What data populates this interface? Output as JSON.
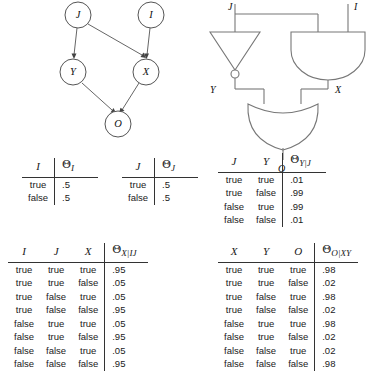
{
  "figure": {
    "caption": "",
    "dag": {
      "title": "bayesian-network",
      "nodes": [
        {
          "id": "J",
          "label": "J",
          "cx": 78,
          "cy": 15
        },
        {
          "id": "I",
          "label": "I",
          "cx": 151,
          "cy": 15
        },
        {
          "id": "Y",
          "label": "Y",
          "cx": 73,
          "cy": 72
        },
        {
          "id": "X",
          "label": "X",
          "cx": 146,
          "cy": 72
        },
        {
          "id": "O",
          "label": "O",
          "cx": 118,
          "cy": 124
        }
      ],
      "edges": [
        {
          "from": "J",
          "to": "Y"
        },
        {
          "from": "J",
          "to": "X"
        },
        {
          "from": "I",
          "to": "X"
        },
        {
          "from": "Y",
          "to": "O"
        },
        {
          "from": "X",
          "to": "O"
        }
      ]
    },
    "circuit": {
      "title": "logic-circuit",
      "input_labels": [
        "J",
        "I"
      ],
      "internal_labels": [
        "Y",
        "X"
      ],
      "output_label": "O",
      "gates": [
        {
          "name": "not-gate",
          "type": "NOT",
          "inputs": [
            "J"
          ],
          "output": "Y"
        },
        {
          "name": "and-gate",
          "type": "AND",
          "inputs": [
            "J",
            "I"
          ],
          "output": "X"
        },
        {
          "name": "or-gate",
          "type": "OR",
          "inputs": [
            "Y",
            "X"
          ],
          "output": "O"
        }
      ]
    }
  },
  "tables": {
    "table_i": {
      "name": "cpt-i",
      "headers": [
        "I",
        "Θ",
        "I"
      ],
      "var_header": "I",
      "theta_base": "Θ",
      "theta_sub": "I",
      "rows": [
        {
          "cells": [
            "true"
          ],
          "param": ".5"
        },
        {
          "cells": [
            "false"
          ],
          "param": ".5"
        }
      ]
    },
    "table_j": {
      "name": "cpt-j",
      "var_header": "J",
      "theta_base": "Θ",
      "theta_sub": "J",
      "rows": [
        {
          "cells": [
            "true"
          ],
          "param": ".5"
        },
        {
          "cells": [
            "false"
          ],
          "param": ".5"
        }
      ]
    },
    "table_y": {
      "name": "cpt-y-given-j",
      "headers": [
        "J",
        "Y"
      ],
      "theta_base": "Θ",
      "theta_sub": "Y|J",
      "rows": [
        {
          "cells": [
            "true",
            "true"
          ],
          "param": ".01"
        },
        {
          "cells": [
            "true",
            "false"
          ],
          "param": ".99"
        },
        {
          "cells": [
            "false",
            "true"
          ],
          "param": ".99"
        },
        {
          "cells": [
            "false",
            "false"
          ],
          "param": ".01"
        }
      ]
    },
    "table_x": {
      "name": "cpt-x-given-ij",
      "headers": [
        "I",
        "J",
        "X"
      ],
      "theta_base": "Θ",
      "theta_sub": "X|IJ",
      "rows": [
        {
          "cells": [
            "true",
            "true",
            "true"
          ],
          "param": ".95"
        },
        {
          "cells": [
            "true",
            "true",
            "false"
          ],
          "param": ".05"
        },
        {
          "cells": [
            "true",
            "false",
            "true"
          ],
          "param": ".05"
        },
        {
          "cells": [
            "true",
            "false",
            "false"
          ],
          "param": ".95"
        },
        {
          "cells": [
            "false",
            "true",
            "true"
          ],
          "param": ".05"
        },
        {
          "cells": [
            "false",
            "true",
            "false"
          ],
          "param": ".95"
        },
        {
          "cells": [
            "false",
            "false",
            "true"
          ],
          "param": ".05"
        },
        {
          "cells": [
            "false",
            "false",
            "false"
          ],
          "param": ".95"
        }
      ]
    },
    "table_o": {
      "name": "cpt-o-given-xy",
      "headers": [
        "X",
        "Y",
        "O"
      ],
      "theta_base": "Θ",
      "theta_sub": "O|XY",
      "rows": [
        {
          "cells": [
            "true",
            "true",
            "true"
          ],
          "param": ".98"
        },
        {
          "cells": [
            "true",
            "true",
            "false"
          ],
          "param": ".02"
        },
        {
          "cells": [
            "true",
            "false",
            "true"
          ],
          "param": ".98"
        },
        {
          "cells": [
            "true",
            "false",
            "false"
          ],
          "param": ".02"
        },
        {
          "cells": [
            "false",
            "true",
            "true"
          ],
          "param": ".98"
        },
        {
          "cells": [
            "false",
            "true",
            "false"
          ],
          "param": ".02"
        },
        {
          "cells": [
            "false",
            "false",
            "true"
          ],
          "param": ".02"
        },
        {
          "cells": [
            "false",
            "false",
            "false"
          ],
          "param": ".98"
        }
      ]
    }
  },
  "colors": {
    "ink": "#1a1a1a",
    "line": "#666666",
    "wire": "#777777",
    "background": "#ffffff"
  }
}
